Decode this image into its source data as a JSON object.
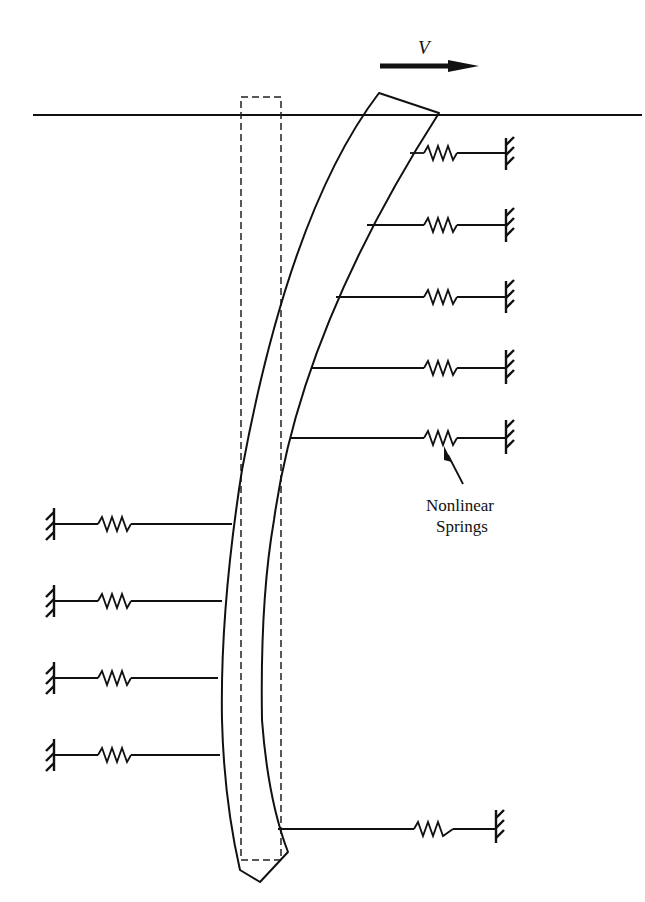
{
  "diagram": {
    "type": "laterally loaded pile with nonlinear soil springs",
    "load": {
      "label": "V",
      "direction": "right"
    },
    "annotation": {
      "line1": "Nonlinear",
      "line2": "Springs"
    },
    "ground_surface": true,
    "undeformed_pile_outline": "dashed",
    "right_springs_count": 6,
    "left_springs_count": 4
  }
}
